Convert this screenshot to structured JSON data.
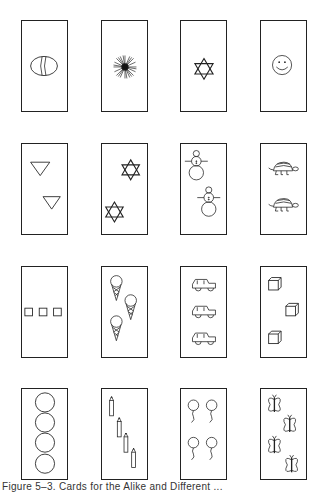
{
  "figure": {
    "caption": "Figure 5–3. Cards for the Alike and Different ...",
    "ink_color": "#222222",
    "background": "#ffffff",
    "grid": {
      "rows": 4,
      "columns": 4
    },
    "cards": [
      {
        "row": 1,
        "col": 1,
        "content": "ball",
        "count": 1
      },
      {
        "row": 1,
        "col": 2,
        "content": "starburst",
        "count": 1
      },
      {
        "row": 1,
        "col": 3,
        "content": "star-of-david",
        "count": 1
      },
      {
        "row": 1,
        "col": 4,
        "content": "smiley-face",
        "count": 1
      },
      {
        "row": 2,
        "col": 1,
        "content": "triangle",
        "count": 2
      },
      {
        "row": 2,
        "col": 2,
        "content": "star-of-david",
        "count": 2
      },
      {
        "row": 2,
        "col": 3,
        "content": "snowman",
        "count": 2
      },
      {
        "row": 2,
        "col": 4,
        "content": "turtle",
        "count": 2
      },
      {
        "row": 3,
        "col": 1,
        "content": "square",
        "count": 3
      },
      {
        "row": 3,
        "col": 2,
        "content": "ice-cream-cone",
        "count": 3
      },
      {
        "row": 3,
        "col": 3,
        "content": "car",
        "count": 3
      },
      {
        "row": 3,
        "col": 4,
        "content": "cube",
        "count": 3
      },
      {
        "row": 4,
        "col": 1,
        "content": "circle",
        "count": 4
      },
      {
        "row": 4,
        "col": 2,
        "content": "pencil",
        "count": 4
      },
      {
        "row": 4,
        "col": 3,
        "content": "balloon",
        "count": 4
      },
      {
        "row": 4,
        "col": 4,
        "content": "butterfly",
        "count": 4
      }
    ]
  }
}
